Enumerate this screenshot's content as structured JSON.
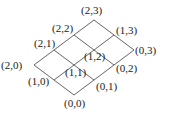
{
  "diagram": {
    "type": "lattice",
    "origin": [
      74,
      95
    ],
    "i_step": [
      -20,
      -15
    ],
    "j_step": [
      20,
      -15
    ],
    "i_max": 2,
    "j_max": 3,
    "line_color": "#555555",
    "nodes": [
      {
        "id": "0,0",
        "label": "(0,0)",
        "i": 0,
        "j": 0,
        "dx": -10,
        "dy": 12
      },
      {
        "id": "1,0",
        "label": "(1,0)",
        "i": 1,
        "j": 0,
        "dx": -26,
        "dy": 5
      },
      {
        "id": "2,0",
        "label": "(2,0)",
        "i": 2,
        "j": 0,
        "dx": -33,
        "dy": 4
      },
      {
        "id": "0,1",
        "label": "(0,1)",
        "i": 0,
        "j": 1,
        "dx": 2,
        "dy": 10
      },
      {
        "id": "1,1",
        "label": "(1,1)",
        "i": 1,
        "j": 1,
        "dx": -9,
        "dy": 11
      },
      {
        "id": "2,1",
        "label": "(2,1)",
        "i": 2,
        "j": 1,
        "dx": -20,
        "dy": -3
      },
      {
        "id": "0,2",
        "label": "(0,2)",
        "i": 0,
        "j": 2,
        "dx": 2,
        "dy": 7
      },
      {
        "id": "1,2",
        "label": "(1,2)",
        "i": 1,
        "j": 2,
        "dx": -10,
        "dy": 10
      },
      {
        "id": "2,2",
        "label": "(2,2)",
        "i": 2,
        "j": 2,
        "dx": -22,
        "dy": -3
      },
      {
        "id": "0,3",
        "label": "(0,3)",
        "i": 0,
        "j": 3,
        "dx": 1,
        "dy": 4
      },
      {
        "id": "1,3",
        "label": "(1,3)",
        "i": 1,
        "j": 3,
        "dx": 2,
        "dy": -1
      },
      {
        "id": "2,3",
        "label": "(2,3)",
        "i": 2,
        "j": 3,
        "dx": -13,
        "dy": -6
      }
    ]
  }
}
